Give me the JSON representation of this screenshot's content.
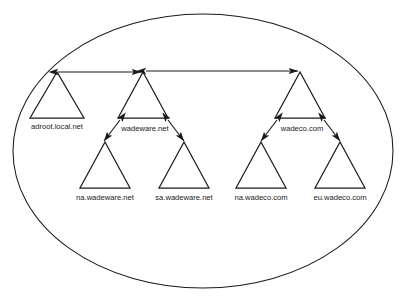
{
  "diagram": {
    "type": "active-directory-forest-trust-diagram",
    "container": {
      "name": "forest-boundary",
      "shape": "ellipse",
      "cx": 203,
      "cy": 151,
      "rx": 190,
      "ry": 137
    },
    "stroke_color": "#1a1a1a",
    "background_color": "#ffffff",
    "tree_root_domains": [
      {
        "id": "adroot",
        "label": "adroot.local.net",
        "apex_x": 57,
        "apex_y": 72,
        "base_y": 118,
        "half_width": 27,
        "label_x": 57,
        "label_y": 129
      },
      {
        "id": "wadeware",
        "label": "wadeware.net",
        "apex_x": 143,
        "apex_y": 72,
        "base_y": 118,
        "half_width": 25,
        "label_x": 145,
        "label_y": 131
      },
      {
        "id": "wadeco",
        "label": "wadeco.com",
        "apex_x": 300,
        "apex_y": 72,
        "base_y": 118,
        "half_width": 25,
        "label_x": 302,
        "label_y": 131
      }
    ],
    "child_domains": [
      {
        "id": "na-wadeware",
        "label": "na.wadeware.net",
        "apex_x": 105,
        "apex_y": 142,
        "base_y": 188,
        "half_width": 25,
        "label_x": 105,
        "label_y": 200
      },
      {
        "id": "sa-wadeware",
        "label": "sa.wadeware.net",
        "apex_x": 184,
        "apex_y": 142,
        "base_y": 188,
        "half_width": 25,
        "label_x": 184,
        "label_y": 200
      },
      {
        "id": "na-wadeco",
        "label": "na.wadeco.com",
        "apex_x": 261,
        "apex_y": 142,
        "base_y": 188,
        "half_width": 25,
        "label_x": 261,
        "label_y": 200
      },
      {
        "id": "eu-wadeco",
        "label": "eu.wadeco.com",
        "apex_x": 340,
        "apex_y": 142,
        "base_y": 188,
        "half_width": 25,
        "label_x": 340,
        "label_y": 200
      }
    ],
    "tree_root_trusts": [
      {
        "id": "trust-adroot-wadeware",
        "from": "adroot.local.net",
        "to": "wadeware.net",
        "x1": 58,
        "y1": 72,
        "x2": 141,
        "y2": 72,
        "double_headed": true
      },
      {
        "id": "trust-wadeware-wadeco",
        "from": "wadeware.net",
        "to": "wadeco.com",
        "x1": 146,
        "y1": 71,
        "x2": 298,
        "y2": 71,
        "double_headed": true
      }
    ],
    "parent_child_trusts": [
      {
        "id": "trust-wadeware-na",
        "from": "wadeware.net",
        "to": "na.wadeware.net",
        "x1": 120,
        "y1": 120,
        "x2": 104,
        "y2": 141,
        "double_headed": true
      },
      {
        "id": "trust-wadeware-sa",
        "from": "wadeware.net",
        "to": "sa.wadeware.net",
        "x1": 168,
        "y1": 120,
        "x2": 184,
        "y2": 141,
        "double_headed": true
      },
      {
        "id": "trust-wadeco-na",
        "from": "wadeco.com",
        "to": "na.wadeco.com",
        "x1": 277,
        "y1": 120,
        "x2": 261,
        "y2": 141,
        "double_headed": true
      },
      {
        "id": "trust-wadeco-eu",
        "from": "wadeco.com",
        "to": "eu.wadeco.com",
        "x1": 324,
        "y1": 120,
        "x2": 340,
        "y2": 141,
        "double_headed": true
      }
    ]
  }
}
